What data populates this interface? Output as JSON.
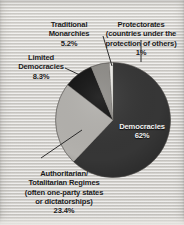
{
  "figure": {
    "background_color": "#dcdad6",
    "text_color": "#1b1b1b"
  },
  "chart_data": {
    "type": "pie",
    "title": "",
    "subtitle": "",
    "xlabel": "",
    "ylabel": "",
    "legend_position": "none",
    "grid": false,
    "units": "percent of world governments",
    "start_angle_deg": 0,
    "direction": "clockwise",
    "categories": [
      "Democracies",
      "Authoritarian/Totalitarian Regimes (often one-party states or dictatorships)",
      "Limited Democracies",
      "Traditional Monarchies",
      "Protectorates (countries under the protection of others)"
    ],
    "values": [
      62,
      23.4,
      8.3,
      5.2,
      1
    ],
    "colors": [
      "#363636",
      "#b3b1ad",
      "#131313",
      "#8e8c88",
      "#efeeea"
    ],
    "slices": [
      {
        "name": "Democracies",
        "label": "Democracies",
        "value": 62,
        "value_text": "62%",
        "color": "#363636",
        "label_placement": "inside",
        "label_color": "#f2f2f0",
        "leader_line": false
      },
      {
        "name": "Authoritarian/Totalitarian Regimes",
        "label": "Authoritarian/\nTotalitarian Regimes\n(often one-party states\nor dictatorships)",
        "value": 23.4,
        "value_text": "23.4%",
        "color": "#b3b1ad",
        "label_placement": "outside-bottom-left",
        "label_color": "#1b1b1b",
        "leader_line": true
      },
      {
        "name": "Limited Democracies",
        "label": "Limited\nDemocracies",
        "value": 8.3,
        "value_text": "8.3%",
        "color": "#131313",
        "label_placement": "outside-left",
        "label_color": "#1b1b1b",
        "leader_line": true
      },
      {
        "name": "Traditional Monarchies",
        "label": "Traditional\nMonarchies",
        "value": 5.2,
        "value_text": "5.2%",
        "color": "#8e8c88",
        "label_placement": "outside-top-left",
        "label_color": "#1b1b1b",
        "leader_line": true
      },
      {
        "name": "Protectorates",
        "label": "Protectorates\n(countries under the\nprotection of others)",
        "value": 1,
        "value_text": "1%",
        "color": "#efeeea",
        "label_placement": "outside-top-right",
        "label_color": "#1b1b1b",
        "leader_line": true
      }
    ]
  },
  "labels": {
    "democracies": {
      "name": "Democracies",
      "percent": "62%"
    },
    "authoritarian": {
      "name": "Authoritarian/\nTotalitarian Regimes\n(often one-party states\nor dictatorships)",
      "percent": "23.4%"
    },
    "limited_democracies": {
      "name": "Limited\nDemocracies",
      "percent": "8.3%"
    },
    "traditional_monarchies": {
      "name": "Traditional\nMonarchies",
      "percent": "5.2%"
    },
    "protectorates": {
      "name": "Protectorates\n(countries under the\nprotection of others)",
      "percent": "1%"
    }
  }
}
